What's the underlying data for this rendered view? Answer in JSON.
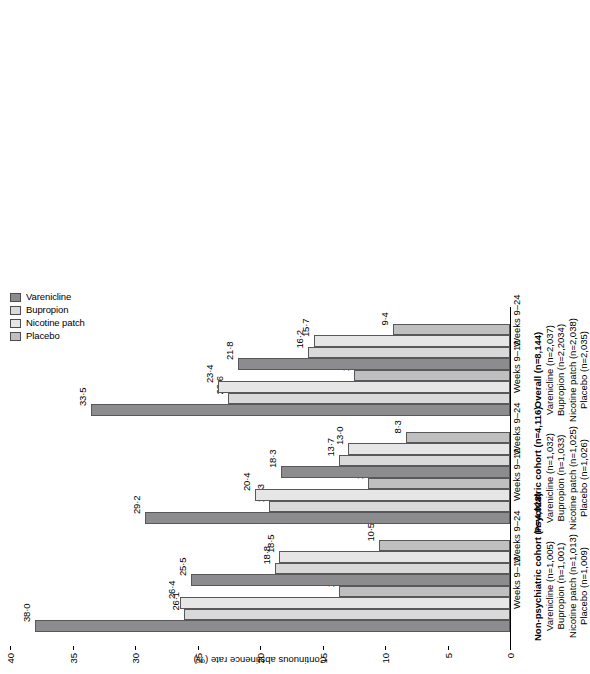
{
  "chart_data": {
    "type": "bar",
    "orientation": "horizontal",
    "title": "",
    "xlabel": "",
    "ylabel": "Continuous abstinence rate (%)",
    "ylim": [
      0,
      40
    ],
    "yticks": [
      0,
      5,
      10,
      15,
      20,
      25,
      30,
      35,
      40
    ],
    "ytick_labels": [
      "0",
      "5",
      "10",
      "15",
      "20",
      "25",
      "30",
      "35",
      "40"
    ],
    "grid": false,
    "legend_position": "top-right",
    "categories": [
      "Non-psychiatric cohort Weeks 9-12",
      "Non-psychiatric cohort Weeks 9-24",
      "Psychiatric cohort Weeks 9-12",
      "Psychiatric cohort Weeks 9-24",
      "Overall Weeks 9-12",
      "Overall Weeks 9-24"
    ],
    "series": [
      {
        "name": "Varenicline",
        "color": "#8c8c8e",
        "values": [
          38.0,
          25.5,
          29.2,
          18.3,
          33.5,
          21.8
        ],
        "labels": [
          "38·0",
          "25·5",
          "29·2",
          "18·3",
          "33·5",
          "21·8"
        ]
      },
      {
        "name": "Bupropion",
        "color": "#d9d9d9",
        "values": [
          26.1,
          18.8,
          19.3,
          13.7,
          22.6,
          16.2
        ],
        "labels": [
          "26·1",
          "18·8",
          "19·3",
          "13·7",
          "22·6",
          "16·2"
        ]
      },
      {
        "name": "Nicotine patch",
        "color": "#e6e6e6",
        "values": [
          26.4,
          18.5,
          20.4,
          13.0,
          23.4,
          15.7
        ],
        "labels": [
          "26·4",
          "18·5",
          "20·4",
          "13·0",
          "23·4",
          "15·7"
        ]
      },
      {
        "name": "Placebo",
        "color": "#bfbfbf",
        "values": [
          13.7,
          10.5,
          11.4,
          8.3,
          12.5,
          9.4
        ],
        "labels": [
          "13·7",
          "10·5",
          "11·4",
          "8·3",
          "12·5",
          "9·4"
        ]
      }
    ],
    "group_tick_labels": [
      "Weeks 9–12",
      "Weeks 9–24",
      "Weeks 9–12",
      "Weeks 9–24",
      "Weeks 9–12",
      "Weeks 9–24"
    ]
  },
  "legend": {
    "items": [
      {
        "label": "Varenicline",
        "color": "#8c8c8e"
      },
      {
        "label": "Bupropion",
        "color": "#d9d9d9"
      },
      {
        "label": "Nicotine patch",
        "color": "#e6e6e6"
      },
      {
        "label": "Placebo",
        "color": "#bfbfbf"
      }
    ]
  },
  "axis": {
    "title": "Continuous abstinence rate (%)",
    "ticks": [
      "40",
      "35",
      "30",
      "25",
      "20",
      "15",
      "10",
      "5",
      "0"
    ]
  },
  "cohorts": [
    {
      "title": "Non-psychiatric cohort (n=4,028)",
      "arms": [
        "Varenicline (n=1,005)",
        "Bupropion (n=1,001)",
        "Nicotine patch (n=1,013)",
        "Placebo (n=1,009)"
      ]
    },
    {
      "title": "Psychiatric cohort (n=4,116)",
      "arms": [
        "Varenicline (n=1,032)",
        "Bupropion (n=1,033)",
        "Nicotine patch (n=1,025)",
        "Placebo (n=1,026)"
      ]
    },
    {
      "title": "Overall (n=8,144)",
      "arms": [
        "Varenicline (n=2,037)",
        "Bupropion (n=2,2034)",
        "Nicotine patch (n=2,038)",
        "Placebo (n=2,035)"
      ]
    }
  ]
}
